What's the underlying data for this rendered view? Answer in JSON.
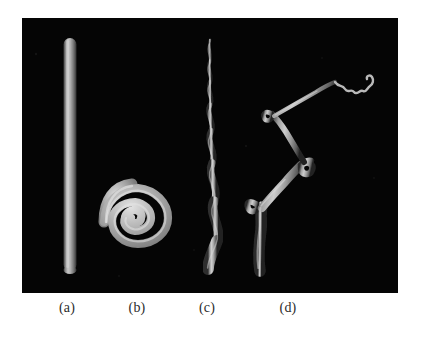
{
  "figure": {
    "background_color": "#ffffff",
    "panel": {
      "name": "render-panel",
      "background_color": "#050505",
      "x": 22,
      "y": 18,
      "width": 376,
      "height": 275
    },
    "tube_color_light": "#d8d8d8",
    "tube_color_mid": "#9a9a9a",
    "tube_color_dark": "#3a3a3a"
  },
  "captions": [
    {
      "label": "(a)",
      "x": 67
    },
    {
      "label": "(b)",
      "x": 137
    },
    {
      "label": "(c)",
      "x": 207
    },
    {
      "label": "(d)",
      "x": 288
    }
  ],
  "objects": [
    {
      "id": "straight-rod",
      "caption": "(a)",
      "description": "straight vertical cylindrical rod",
      "path": "M 48 20 L 48 252",
      "stroke_width": 13
    },
    {
      "id": "spiral-coil",
      "caption": "(b)",
      "description": "flat archimedean spiral coil",
      "center_x": 116,
      "center_y": 204,
      "turns": 3.6,
      "outer_radius": 38,
      "stroke_width": 9
    },
    {
      "id": "wavy-filament",
      "caption": "(c)",
      "description": "sinuous tapering filament, thin at top thick at bottom",
      "path": "M 188 22 C 184 32 192 38 188 48 C 184 58 193 64 189 74 C 184 86 194 94 189 106 C 183 120 196 130 190 146 C 183 164 200 176 193 196 C 187 214 200 226 194 240 C 190 248 186 250 186 252",
      "stroke_width_top": 3,
      "stroke_width_bottom": 13
    },
    {
      "id": "branched-filament",
      "caption": "(d)",
      "description": "branched tree-like filament with loops and a thin zigzag tip",
      "trunk_path": "M 238 254 C 236 238 238 224 239 210 C 240 198 238 190 240 182",
      "branch_path": "M 240 186 C 248 178 258 172 266 164 C 274 156 282 150 290 142",
      "loop_path": "M 290 142 C 296 136 300 130 306 126",
      "tip_path": "M 306 126 C 312 120 318 124 324 118 C 330 112 336 118 342 112",
      "stroke_width_trunk": 12,
      "stroke_width_tip": 2
    }
  ]
}
